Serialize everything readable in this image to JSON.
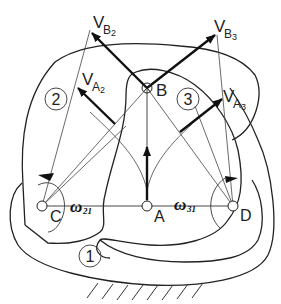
{
  "diagram": {
    "type": "mechanism velocity diagram",
    "points": {
      "A": "A",
      "B": "B",
      "C": "C",
      "D": "D"
    },
    "links": [
      {
        "id": "link-1",
        "label": "1"
      },
      {
        "id": "link-2",
        "label": "2"
      },
      {
        "id": "link-3",
        "label": "3"
      }
    ],
    "velocities": {
      "VB2": {
        "main": "V",
        "sub": "B",
        "subsub": "2"
      },
      "VB3": {
        "main": "V",
        "sub": "B",
        "subsub": "3"
      },
      "VA2": {
        "main": "V",
        "sub": "A",
        "subsub": "2"
      },
      "VA3": {
        "main": "V",
        "sub": "A",
        "subsub": "3"
      }
    },
    "angular_velocities": {
      "w21": {
        "symbol": "ω",
        "sub": "21"
      },
      "w31": {
        "symbol": "ω",
        "sub": "31"
      }
    },
    "colors": {
      "line": "#222222",
      "background": "#ffffff"
    }
  }
}
